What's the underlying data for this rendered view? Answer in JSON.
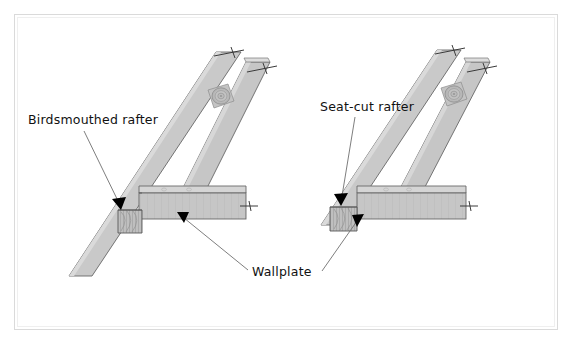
{
  "figure": {
    "title_visible": false,
    "background_color": "#ffffff",
    "frame": {
      "name": "outer-frame",
      "stroke": "#d8d8d8",
      "x": 14,
      "y": 14,
      "width": 544,
      "height": 316
    },
    "colors": {
      "wood_face_light": "#cfcfcf",
      "wood_face_mid": "#c2c2c2",
      "wood_face_dark": "#b4b4b4",
      "wood_top_highlight": "#dcdcdc",
      "endgrain_fill": "#bdbdbd",
      "outline": "#555555",
      "leader_line": "#6a6a6a",
      "arrow_fill": "#000000",
      "text": "#111111"
    }
  },
  "labels": {
    "birdsmouth": {
      "text": "Birdsmouthed rafter",
      "x": 28,
      "y": 124,
      "anchor": "start"
    },
    "seatcut": {
      "text": "Seat-cut rafter",
      "x": 320,
      "y": 111,
      "anchor": "start"
    },
    "wallplate": {
      "text": "Wallplate",
      "x": 252,
      "y": 276,
      "anchor": "start"
    }
  },
  "leaders": [
    {
      "name": "leader-birdsmouth",
      "from_label": "birdsmouth",
      "points": "84,131 121,207",
      "arrow_at": "121,207",
      "arrow_angle": 64
    },
    {
      "name": "leader-wallplate-left",
      "from_label": "wallplate",
      "points": "248,272 178,213",
      "arrow_at": "178,213",
      "arrow_angle": 220
    },
    {
      "name": "leader-seatcut",
      "from_label": "seatcut",
      "points": "355,117 341,203",
      "arrow_at": "341,203",
      "arrow_angle": 80
    },
    {
      "name": "leader-wallplate-right",
      "from_label": "wallplate",
      "points": "324,272 362,217",
      "arrow_at": "362,217",
      "arrow_angle": 305
    }
  ],
  "assemblies": [
    {
      "name": "birdsmouth-assembly",
      "caption_ref": "birdsmouth",
      "description": "Rafter notched with a birdsmouth sitting on the wallplate, rafter tail overhangs past the plate",
      "rafter_has_tail": true,
      "knot_marks": 1,
      "break_marks": 3
    },
    {
      "name": "seatcut-assembly",
      "caption_ref": "seatcut",
      "description": "Rafter with a plain seat cut bearing on the wallplate, rafter stops at the plate face",
      "rafter_has_tail": false,
      "knot_marks": 1,
      "break_marks": 3
    }
  ],
  "wallplates": [
    {
      "name": "wallplate-left",
      "break_mark": true
    },
    {
      "name": "wallplate-right",
      "break_mark": true
    }
  ]
}
